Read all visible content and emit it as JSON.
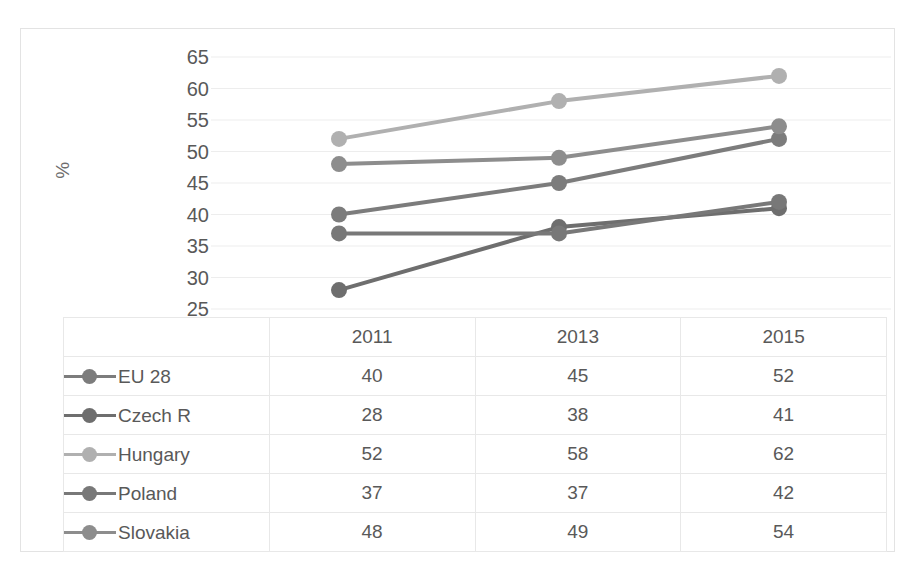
{
  "axis": {
    "y_title": "%",
    "y_ticks": [
      65,
      60,
      55,
      50,
      45,
      40,
      35,
      30,
      25
    ]
  },
  "table": {
    "corner_label": "",
    "columns": [
      "2011",
      "2013",
      "2015"
    ],
    "rows": [
      {
        "label": "EU 28",
        "key_color": "#7c7c7c",
        "values": [
          "40",
          "45",
          "52"
        ]
      },
      {
        "label": "Czech R",
        "key_color": "#6e6e6e",
        "values": [
          "28",
          "38",
          "41"
        ]
      },
      {
        "label": "Hungary",
        "key_color": "#b0b0b0",
        "values": [
          "52",
          "58",
          "62"
        ]
      },
      {
        "label": "Poland",
        "key_color": "#787878",
        "values": [
          "37",
          "37",
          "42"
        ]
      },
      {
        "label": "Slovakia",
        "key_color": "#8d8d8d",
        "values": [
          "48",
          "49",
          "54"
        ]
      }
    ]
  },
  "chart_data": {
    "type": "line",
    "title": "",
    "xlabel": "",
    "ylabel": "%",
    "categories": [
      "2011",
      "2013",
      "2015"
    ],
    "ylim": [
      25,
      65
    ],
    "ytick_step": 5,
    "grid": true,
    "legend_position": "table-row-labels",
    "marker": "circle",
    "series": [
      {
        "name": "EU 28",
        "values": [
          40,
          45,
          52
        ],
        "color": "#7c7c7c"
      },
      {
        "name": "Czech R",
        "values": [
          28,
          38,
          41
        ],
        "color": "#6e6e6e"
      },
      {
        "name": "Hungary",
        "values": [
          52,
          58,
          62
        ],
        "color": "#b0b0b0"
      },
      {
        "name": "Poland",
        "values": [
          37,
          37,
          42
        ],
        "color": "#787878"
      },
      {
        "name": "Slovakia",
        "values": [
          48,
          49,
          54
        ],
        "color": "#8d8d8d"
      }
    ]
  },
  "colors": {
    "grid": "#ededed",
    "border": "#e3e3e3",
    "text": "#595959"
  }
}
